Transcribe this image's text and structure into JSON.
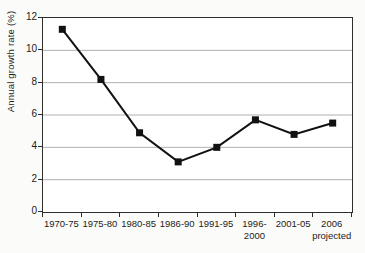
{
  "figure": {
    "background": "#fbfbf9",
    "plot_background": "#ffffff",
    "axis_color": "#2e2e2e",
    "grid_color": "#b0b0b0",
    "line_color": "#111111",
    "marker_color": "#111111",
    "text_color": "#1b1b1b"
  },
  "chart_data": {
    "type": "line",
    "title": "",
    "xlabel": "",
    "ylabel": "Annual growth rate (%)",
    "categories": [
      "1970-75",
      "1975-80",
      "1980-85",
      "1986-90",
      "1991-95",
      "1996-\n2000",
      "2001-05",
      "2006\nprojected"
    ],
    "values": [
      11.3,
      8.2,
      4.9,
      3.1,
      4.0,
      5.7,
      4.8,
      5.5
    ],
    "ylim": [
      0,
      12
    ],
    "y_ticks": [
      0,
      2,
      4,
      6,
      8,
      10,
      12
    ],
    "grid": "horizontal",
    "legend": "none",
    "marker": "square"
  }
}
